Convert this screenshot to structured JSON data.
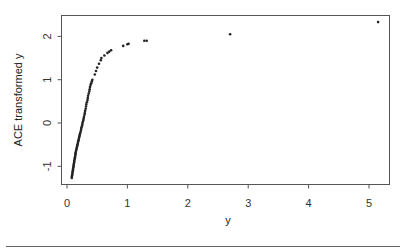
{
  "chart_data": {
    "type": "scatter",
    "title": "",
    "xlabel": "y",
    "ylabel": "ACE transformed y",
    "xlim": [
      -0.05,
      5.35
    ],
    "ylim": [
      -1.45,
      2.5
    ],
    "xticks": [
      0,
      1,
      2,
      3,
      4,
      5
    ],
    "yticks": [
      -1,
      0,
      1,
      2
    ],
    "grid": false,
    "legend": null,
    "series": [
      {
        "name": "ACE transform",
        "marker": "dot",
        "color": "#222222",
        "points": [
          [
            0.08,
            -1.27
          ],
          [
            0.08,
            -1.24
          ],
          [
            0.085,
            -1.21
          ],
          [
            0.09,
            -1.18
          ],
          [
            0.09,
            -1.15
          ],
          [
            0.095,
            -1.12
          ],
          [
            0.1,
            -1.09
          ],
          [
            0.1,
            -1.06
          ],
          [
            0.105,
            -1.03
          ],
          [
            0.11,
            -1.0
          ],
          [
            0.11,
            -0.97
          ],
          [
            0.115,
            -0.94
          ],
          [
            0.12,
            -0.91
          ],
          [
            0.12,
            -0.88
          ],
          [
            0.125,
            -0.85
          ],
          [
            0.13,
            -0.82
          ],
          [
            0.13,
            -0.79
          ],
          [
            0.135,
            -0.76
          ],
          [
            0.14,
            -0.73
          ],
          [
            0.14,
            -0.7
          ],
          [
            0.145,
            -0.67
          ],
          [
            0.15,
            -0.64
          ],
          [
            0.155,
            -0.61
          ],
          [
            0.16,
            -0.58
          ],
          [
            0.165,
            -0.55
          ],
          [
            0.17,
            -0.52
          ],
          [
            0.175,
            -0.49
          ],
          [
            0.18,
            -0.46
          ],
          [
            0.185,
            -0.43
          ],
          [
            0.19,
            -0.4
          ],
          [
            0.195,
            -0.37
          ],
          [
            0.2,
            -0.34
          ],
          [
            0.205,
            -0.31
          ],
          [
            0.21,
            -0.28
          ],
          [
            0.215,
            -0.25
          ],
          [
            0.22,
            -0.22
          ],
          [
            0.23,
            -0.18
          ],
          [
            0.235,
            -0.14
          ],
          [
            0.24,
            -0.1
          ],
          [
            0.25,
            -0.06
          ],
          [
            0.255,
            -0.02
          ],
          [
            0.26,
            0.02
          ],
          [
            0.27,
            0.06
          ],
          [
            0.275,
            0.1
          ],
          [
            0.28,
            0.14
          ],
          [
            0.29,
            0.19
          ],
          [
            0.295,
            0.23
          ],
          [
            0.3,
            0.28
          ],
          [
            0.31,
            0.33
          ],
          [
            0.315,
            0.38
          ],
          [
            0.32,
            0.43
          ],
          [
            0.33,
            0.48
          ],
          [
            0.34,
            0.53
          ],
          [
            0.345,
            0.58
          ],
          [
            0.35,
            0.63
          ],
          [
            0.36,
            0.68
          ],
          [
            0.37,
            0.73
          ],
          [
            0.375,
            0.78
          ],
          [
            0.38,
            0.83
          ],
          [
            0.39,
            0.88
          ],
          [
            0.4,
            0.92
          ],
          [
            0.41,
            0.96
          ],
          [
            0.42,
            1.0
          ],
          [
            0.46,
            1.12
          ],
          [
            0.48,
            1.2
          ],
          [
            0.5,
            1.28
          ],
          [
            0.53,
            1.37
          ],
          [
            0.56,
            1.45
          ],
          [
            0.57,
            1.5
          ],
          [
            0.62,
            1.56
          ],
          [
            0.67,
            1.62
          ],
          [
            0.7,
            1.65
          ],
          [
            0.73,
            1.68
          ],
          [
            0.93,
            1.78
          ],
          [
            1.0,
            1.82
          ],
          [
            1.02,
            1.83
          ],
          [
            1.28,
            1.9
          ],
          [
            1.32,
            1.9
          ],
          [
            2.7,
            2.05
          ],
          [
            5.15,
            2.33
          ]
        ]
      }
    ]
  }
}
